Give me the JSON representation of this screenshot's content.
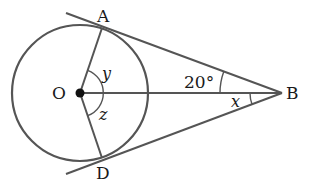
{
  "diagram": {
    "type": "geometry",
    "colors": {
      "line": "#555555",
      "text": "#1a1a1a",
      "background": "#ffffff"
    },
    "points": {
      "O": {
        "label": "O",
        "x": 80,
        "y": 93
      },
      "A": {
        "label": "A",
        "x": 102,
        "y": 28
      },
      "D": {
        "label": "D",
        "x": 102,
        "y": 158
      },
      "B": {
        "label": "B",
        "x": 282,
        "y": 93
      }
    },
    "circle": {
      "center": "O",
      "radius": 68
    },
    "segments": [
      "OA",
      "OD",
      "OB",
      "AB",
      "DB"
    ],
    "angles": {
      "AOB": {
        "label": "y"
      },
      "BOD": {
        "label": "z"
      },
      "ABO": {
        "label": "20°"
      },
      "OBD": {
        "label": "x"
      }
    }
  }
}
